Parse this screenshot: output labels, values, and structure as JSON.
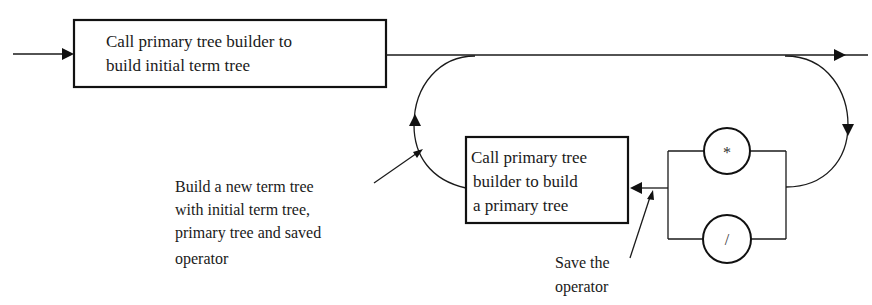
{
  "diagram": {
    "type": "syntax-flow-diagram",
    "colors": {
      "ink": "#1a1a1a",
      "background": "#ffffff"
    },
    "boxes": [
      {
        "id": "initial",
        "lines": [
          "Call primary tree builder to",
          "build initial term tree"
        ]
      },
      {
        "id": "primary",
        "lines": [
          "Call primary tree",
          "builder to build",
          " a primary tree"
        ]
      }
    ],
    "operators": [
      {
        "symbol": "*",
        "name": "multiply"
      },
      {
        "symbol": "/",
        "name": "divide"
      }
    ],
    "annotations": {
      "build_new_tree": [
        "Build a new term tree",
        "with initial term tree,",
        "primary tree and saved",
        "operator"
      ],
      "save_operator": [
        "Save the",
        "operator"
      ]
    }
  }
}
